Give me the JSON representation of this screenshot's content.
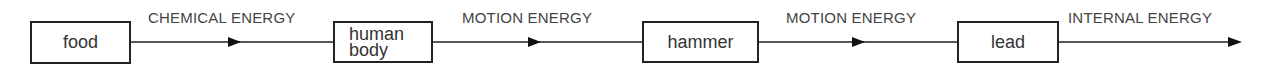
{
  "diagram": {
    "nodes": [
      {
        "id": "food",
        "label": "food"
      },
      {
        "id": "human_body",
        "label_line1": "human",
        "label_line2": "body"
      },
      {
        "id": "hammer",
        "label": "hammer"
      },
      {
        "id": "lead",
        "label": "lead"
      }
    ],
    "edges": [
      {
        "from": "food",
        "to": "human_body",
        "label": "CHEMICAL ENERGY"
      },
      {
        "from": "human_body",
        "to": "hammer",
        "label": "MOTION ENERGY"
      },
      {
        "from": "hammer",
        "to": "lead",
        "label": "MOTION ENERGY"
      },
      {
        "from": "lead",
        "to": "",
        "label": "INTERNAL ENERGY"
      }
    ],
    "colors": {
      "stroke": "#222222",
      "text": "#333333",
      "background": "#ffffff"
    }
  }
}
